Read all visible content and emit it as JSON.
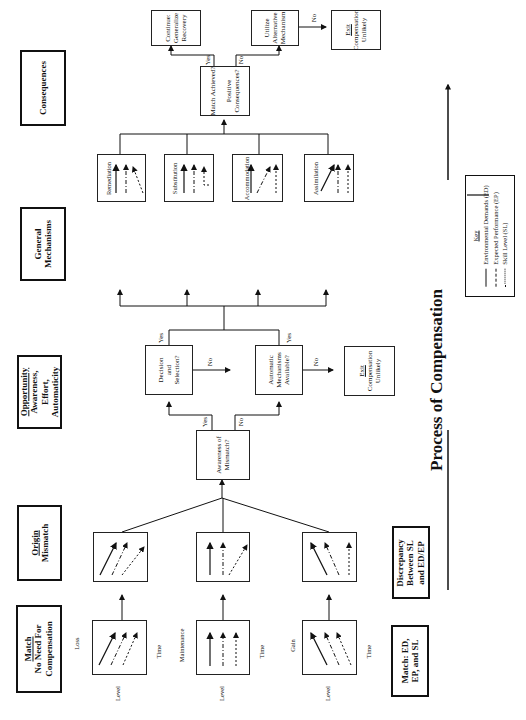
{
  "stage_labels": {
    "match": {
      "title": "Match",
      "lines": [
        "No Need For",
        "Compensation"
      ]
    },
    "origin": {
      "title": "Origin",
      "lines": [
        "Mismatch"
      ]
    },
    "opportunity": {
      "title": "Opportunity",
      "lines": [
        "Awareness,",
        "Effort,",
        "Automaticity"
      ]
    },
    "general_mechanisms": {
      "lines": [
        "General",
        "Mechanisms"
      ]
    },
    "consequences": {
      "lines": [
        "Consequences"
      ]
    }
  },
  "match_boxes": [
    {
      "name": "Loss",
      "ylabel": "Level",
      "xlabel": "Time"
    },
    {
      "name": "Maintenance",
      "ylabel": "Level",
      "xlabel": "Time"
    },
    {
      "name": "Gain",
      "ylabel": "Level",
      "xlabel": "Time"
    }
  ],
  "right_labels": {
    "match": [
      "Match: ED,",
      "EP, and SL"
    ],
    "discrepancy": [
      "Discrepancy",
      "Between SL",
      "and ED/EP"
    ]
  },
  "decision_nodes": {
    "awareness": [
      "Awareness of",
      "Mismatch?"
    ],
    "decision": [
      "Decision",
      "and",
      "Selection?"
    ],
    "automatic": [
      "Automatic",
      "Mechanisms",
      "Available?"
    ],
    "match_achieved": [
      "Match Achieved?",
      "Positive",
      "Consequences?"
    ]
  },
  "exit_nodes": {
    "exit_mid": {
      "title": "Exit",
      "lines": [
        "Compensation",
        "Unlikely"
      ]
    },
    "exit_top": {
      "title": "Exit",
      "lines": [
        "Compensation",
        "Unlikely"
      ]
    }
  },
  "outcome_nodes": {
    "continue": [
      "Continue:",
      "Generalize",
      "Recovery"
    ],
    "utilize": [
      "Utilize",
      "Alternative",
      "Mechanism"
    ]
  },
  "mechanisms": [
    "Remediation",
    "Substitution",
    "Accommodation",
    "Assimilation"
  ],
  "edge_labels": {
    "yes": "Yes",
    "no": "No"
  },
  "title": "Process of Compensation",
  "key": {
    "title": "Key",
    "items": [
      "Environmental Demands (ED)",
      "Expected Performance (EP)",
      "Skill Level (SL)"
    ]
  }
}
